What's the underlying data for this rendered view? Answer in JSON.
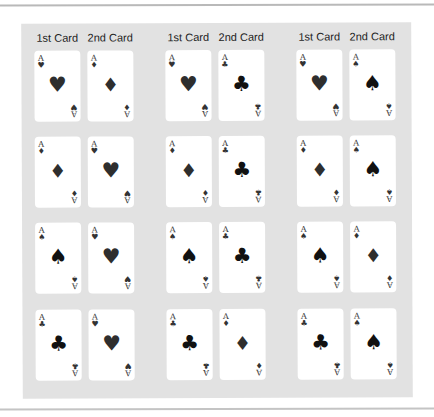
{
  "headers": {
    "first": "1st Card",
    "second": "2nd Card"
  },
  "rank": "A",
  "suit_glyphs": {
    "hearts": "♥",
    "diamonds": "♦",
    "spades": "♠",
    "clubs": "♣"
  },
  "groups": [
    {
      "header_first": "1st Card",
      "header_second": "2nd Card",
      "rows": [
        {
          "first": {
            "rank": "A",
            "suit": "hearts",
            "glyph": "♥"
          },
          "second": {
            "rank": "A",
            "suit": "diamonds",
            "glyph": "♦"
          }
        },
        {
          "first": {
            "rank": "A",
            "suit": "diamonds",
            "glyph": "♦"
          },
          "second": {
            "rank": "A",
            "suit": "hearts",
            "glyph": "♥"
          }
        },
        {
          "first": {
            "rank": "A",
            "suit": "spades",
            "glyph": "♠"
          },
          "second": {
            "rank": "A",
            "suit": "hearts",
            "glyph": "♥"
          }
        },
        {
          "first": {
            "rank": "A",
            "suit": "clubs",
            "glyph": "♣"
          },
          "second": {
            "rank": "A",
            "suit": "hearts",
            "glyph": "♥"
          }
        }
      ]
    },
    {
      "header_first": "1st Card",
      "header_second": "2nd Card",
      "rows": [
        {
          "first": {
            "rank": "A",
            "suit": "hearts",
            "glyph": "♥"
          },
          "second": {
            "rank": "A",
            "suit": "clubs",
            "glyph": "♣"
          }
        },
        {
          "first": {
            "rank": "A",
            "suit": "diamonds",
            "glyph": "♦"
          },
          "second": {
            "rank": "A",
            "suit": "clubs",
            "glyph": "♣"
          }
        },
        {
          "first": {
            "rank": "A",
            "suit": "spades",
            "glyph": "♠"
          },
          "second": {
            "rank": "A",
            "suit": "clubs",
            "glyph": "♣"
          }
        },
        {
          "first": {
            "rank": "A",
            "suit": "clubs",
            "glyph": "♣"
          },
          "second": {
            "rank": "A",
            "suit": "diamonds",
            "glyph": "♦"
          }
        }
      ]
    },
    {
      "header_first": "1st Card",
      "header_second": "2nd Card",
      "rows": [
        {
          "first": {
            "rank": "A",
            "suit": "hearts",
            "glyph": "♥"
          },
          "second": {
            "rank": "A",
            "suit": "spades",
            "glyph": "♠"
          }
        },
        {
          "first": {
            "rank": "A",
            "suit": "diamonds",
            "glyph": "♦"
          },
          "second": {
            "rank": "A",
            "suit": "spades",
            "glyph": "♠"
          }
        },
        {
          "first": {
            "rank": "A",
            "suit": "spades",
            "glyph": "♠"
          },
          "second": {
            "rank": "A",
            "suit": "diamonds",
            "glyph": "♦"
          }
        },
        {
          "first": {
            "rank": "A",
            "suit": "clubs",
            "glyph": "♣"
          },
          "second": {
            "rank": "A",
            "suit": "spades",
            "glyph": "♠"
          }
        }
      ]
    }
  ],
  "colors": {
    "panel": "#e2e2e2",
    "card": "#ffffff",
    "ink": "#111111",
    "rule": "#b9b9b9"
  }
}
